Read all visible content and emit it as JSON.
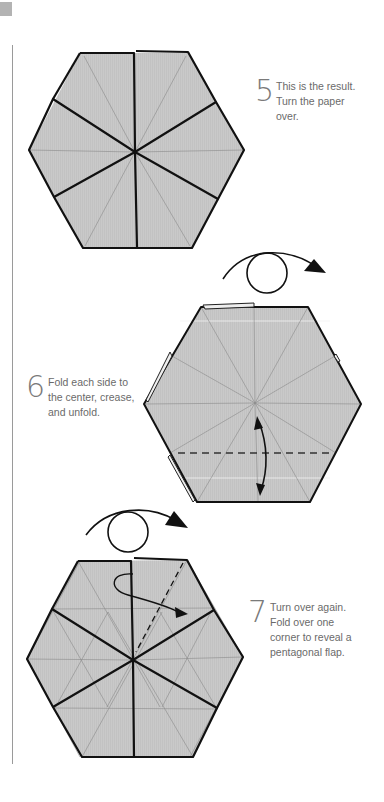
{
  "page": {
    "corner_mark_color": "#b3b3b3",
    "paper_color": "#c8c8c8",
    "line_color": "#111111",
    "crease_color": "#8a8a8a"
  },
  "steps": [
    {
      "number": "5",
      "text": "This is the result.\nTurn the paper\nover.",
      "action": "turn-over"
    },
    {
      "number": "6",
      "text": "Fold each side to\nthe center, crease,\nand unfold.",
      "action": "fold-and-unfold"
    },
    {
      "number": "7",
      "text": "Turn over again.\nFold over one\ncorner to reveal a\npentagonal flap.",
      "action": "fold-corner"
    }
  ],
  "icons": {
    "turn_over": "turn-over-arrow-icon",
    "fold_unfold": "double-headed-arrow-icon",
    "fold_over": "curved-fold-arrow-icon"
  }
}
